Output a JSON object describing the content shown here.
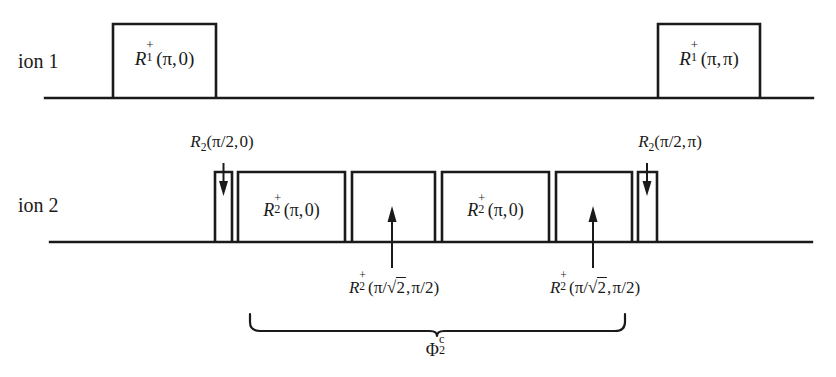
{
  "figure": {
    "type": "pulse-sequence-timing-diagram",
    "background_color": "#ffffff",
    "line_color": "#1a1a1a"
  },
  "rows": [
    {
      "id": "ion1",
      "label": "ion 1",
      "baseline_y": 98,
      "baseline_x_start": 45,
      "baseline_x_end": 813
    },
    {
      "id": "ion2",
      "label": "ion 2",
      "baseline_y": 242,
      "baseline_x_start": 50,
      "baseline_x_end": 812
    }
  ],
  "ion1_pulses": [
    {
      "name": "pulse-r1-pi-0",
      "label": "R_1^+(π,0)",
      "label_parts": {
        "R": "R",
        "sub": "1",
        "sup": "+",
        "args": "(π, 0)"
      },
      "x": 113,
      "width": 103,
      "top_y": 24,
      "inside_label": true
    },
    {
      "name": "pulse-r1-pi-pi",
      "label": "R_1^+(π,π)",
      "label_parts": {
        "R": "R",
        "sub": "1",
        "sup": "+",
        "args": "(π, π)"
      },
      "x": 658,
      "width": 102,
      "top_y": 24,
      "inside_label": true
    }
  ],
  "ion2_pulses": [
    {
      "name": "pulse-r2-pi2-0",
      "x": 215,
      "width": 17,
      "top_y": 172,
      "inside_label": false,
      "annotation": "R_2(π/2,0)",
      "annotation_position": "above",
      "arrow": "down"
    },
    {
      "name": "pulse-r2-plus-pi-0-first",
      "x": 238,
      "width": 107,
      "top_y": 172,
      "inside_label": true,
      "label": "R_2^+(π,0)"
    },
    {
      "name": "pulse-r2-plus-pi-sqrt2-first",
      "x": 352,
      "width": 83,
      "top_y": 172,
      "inside_label": false,
      "annotation": "R_2^+(π/√2,π/2)",
      "annotation_position": "below",
      "arrow": "up",
      "arrow_x": 392
    },
    {
      "name": "pulse-r2-plus-pi-0-second",
      "x": 442,
      "width": 107,
      "top_y": 172,
      "inside_label": true,
      "label": "R_2^+(π,0)"
    },
    {
      "name": "pulse-r2-plus-pi-sqrt2-second",
      "x": 556,
      "width": 76,
      "top_y": 172,
      "inside_label": false,
      "annotation": "R_2^+(π/√2,π/2)",
      "annotation_position": "below",
      "arrow": "up",
      "arrow_x": 593
    },
    {
      "name": "pulse-r2-pi2-pi",
      "x": 638,
      "width": 19,
      "top_y": 172,
      "inside_label": false,
      "annotation": "R_2(π/2,π)",
      "annotation_position": "above",
      "arrow": "down"
    }
  ],
  "annotations": {
    "top_left": {
      "R": "R",
      "sub": "2",
      "args_open": "(",
      "pi": "π",
      "slash": "/",
      "two": "2",
      "comma": ",",
      "phase": "0",
      "args_close": ")"
    },
    "top_right": {
      "R": "R",
      "sub": "2",
      "args_open": "(",
      "pi": "π",
      "slash": "/",
      "two": "2",
      "comma": ",",
      "phase": "π",
      "args_close": ")"
    },
    "bottom_left": {
      "R": "R",
      "sub": "2",
      "sup": "+",
      "args_open": "(",
      "pi": "π",
      "slash": "/",
      "radical": "√",
      "radicand": "2",
      "comma": ",",
      "phase_num": "π",
      "phase_slash": "/",
      "phase_den": "2",
      "args_close": ")"
    },
    "bottom_right": {
      "R": "R",
      "sub": "2",
      "sup": "+",
      "args_open": "(",
      "pi": "π",
      "slash": "/",
      "radical": "√",
      "radicand": "2",
      "comma": ",",
      "phase_num": "π",
      "phase_slash": "/",
      "phase_den": "2",
      "args_close": ")"
    }
  },
  "brace": {
    "name": "phi-2-c-brace",
    "x_start": 250,
    "x_end": 625,
    "y": 314,
    "label_base": "Φ",
    "label_sub": "2",
    "label_sup": "c"
  },
  "pulse_labels": {
    "r1_base": "R",
    "r2_base": "R",
    "plus": "+",
    "one": "1",
    "two": "2",
    "pi": "π",
    "zero": "0",
    "open": "(",
    "close": ")",
    "comma": ","
  }
}
